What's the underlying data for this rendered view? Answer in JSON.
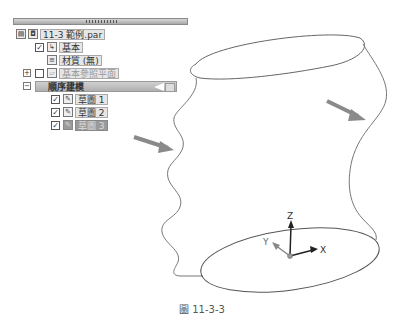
{
  "pathfinder": {
    "file_name": "11-3 範例.par",
    "items": [
      {
        "label": "基本",
        "checked": true
      },
      {
        "label": "材質 (無)"
      },
      {
        "label": "基本參照平面",
        "checked": false,
        "expander": "+"
      },
      {
        "label": "順序建模",
        "expander": "−"
      },
      {
        "label": "草圖 1",
        "checked": true
      },
      {
        "label": "草圖 2",
        "checked": true
      },
      {
        "label": "草圖 3",
        "checked": true,
        "state": "rolled-back"
      }
    ]
  },
  "model": {
    "axis_labels": {
      "x": "X",
      "y": "Y",
      "z": "Z"
    },
    "arrow_color": "#8a8a8a",
    "curve_color": "#777777"
  },
  "caption": "圖 11-3-3"
}
